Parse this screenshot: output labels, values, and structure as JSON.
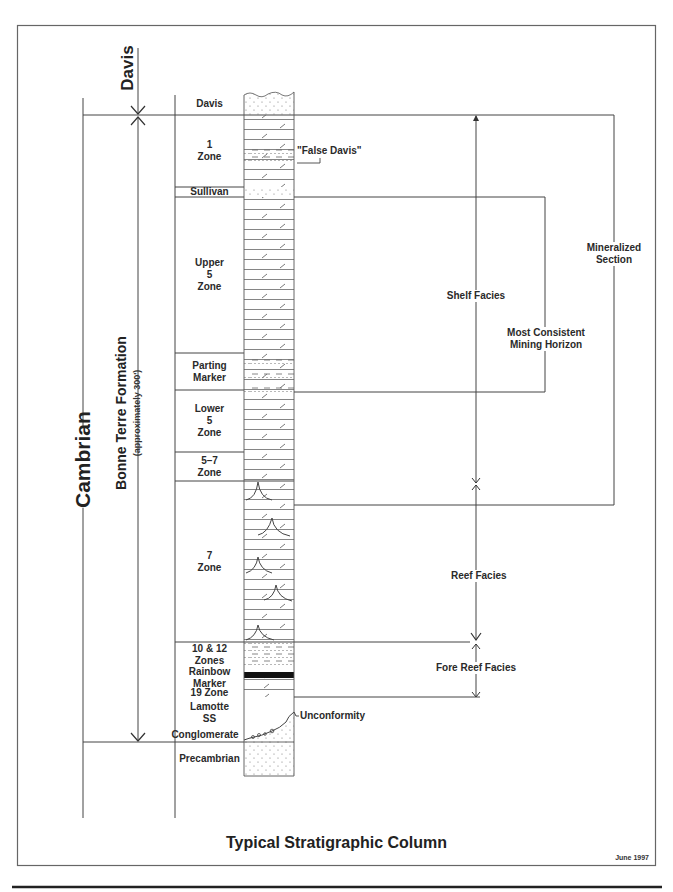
{
  "title": "Typical Stratigraphic Column",
  "date": "June 1997",
  "left_labels": {
    "davis": "Davis",
    "cambrian": "Cambrian",
    "bonne_terre": "Bonne Terre Formation",
    "bonne_terre_thickness": "(approximately 300')"
  },
  "zones": [
    {
      "lines": [
        "Davis"
      ],
      "top": 92,
      "bottom": 115
    },
    {
      "lines": [
        "1",
        "Zone"
      ],
      "top": 115,
      "bottom": 187
    },
    {
      "lines": [
        "Sullivan"
      ],
      "top": 187,
      "bottom": 197
    },
    {
      "lines": [
        "Upper",
        "5",
        "Zone"
      ],
      "top": 197,
      "bottom": 353
    },
    {
      "lines": [
        "Parting",
        "Marker"
      ],
      "top": 353,
      "bottom": 390
    },
    {
      "lines": [
        "Lower",
        "5",
        "Zone"
      ],
      "top": 390,
      "bottom": 452
    },
    {
      "lines": [
        "5–7",
        "Zone"
      ],
      "top": 452,
      "bottom": 481
    },
    {
      "lines": [
        "7",
        "Zone"
      ],
      "top": 481,
      "bottom": 642
    },
    {
      "lines": [
        "10 & 12",
        "Zones"
      ],
      "top": 642,
      "bottom": 667
    },
    {
      "lines": [
        "Rainbow",
        "Marker"
      ],
      "top": 667,
      "bottom": 688
    },
    {
      "lines": [
        "19 Zone"
      ],
      "top": 688,
      "bottom": 697
    },
    {
      "lines": [
        "Lamotte",
        "SS"
      ],
      "top": 697,
      "bottom": 728
    },
    {
      "lines": [
        "Conglomerate"
      ],
      "top": 728,
      "bottom": 742
    },
    {
      "lines": [
        "Precambrian"
      ],
      "top": 742,
      "bottom": 776
    }
  ],
  "annotations": {
    "false_davis": "\"False Davis\"",
    "unconformity": "Unconformity",
    "shelf_facies": "Shelf Facies",
    "reef_facies": "Reef Facies",
    "fore_reef_facies": "Fore Reef Facies",
    "most_consistent": [
      "Most Consistent",
      "Mining Horizon"
    ],
    "mineralized": [
      "Mineralized",
      "Section"
    ]
  },
  "colors": {
    "line": "#444444",
    "frame": "#666666",
    "hatch": "#555555"
  }
}
